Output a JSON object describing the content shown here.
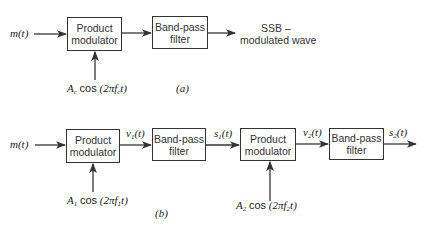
{
  "diagram_a": {
    "input_label": "m(t)",
    "modulator": {
      "line1": "Product",
      "line2": "modulator"
    },
    "filter": {
      "line1": "Band-pass",
      "line2": "filter"
    },
    "output": {
      "line1": "SSB –",
      "line2": "modulated wave"
    },
    "carrier": {
      "amp": "A",
      "amp_sub": "c",
      "cos": "cos",
      "arg_pre": "(2πf",
      "arg_sub": "c",
      "arg_post": "t)"
    },
    "caption": "(a)"
  },
  "diagram_b": {
    "input_label": "m(t)",
    "modulator1": {
      "line1": "Product",
      "line2": "modulator"
    },
    "v1": {
      "base": "v",
      "sub": "1",
      "rest": "(t)"
    },
    "filter1": {
      "line1": "Band-pass",
      "line2": "filter"
    },
    "s1": {
      "base": "s",
      "sub": "1",
      "rest": "(t)"
    },
    "modulator2": {
      "line1": "Product",
      "line2": "modulator"
    },
    "v2": {
      "base": "v",
      "sub": "2",
      "rest": "(t)"
    },
    "filter2": {
      "line1": "Band-pass",
      "line2": "filter"
    },
    "s2": {
      "base": "s",
      "sub": "2",
      "rest": "(t)"
    },
    "carrier1": {
      "amp": "A",
      "amp_sub": "1",
      "cos": "cos",
      "arg_pre": "(2πf",
      "arg_sub": "1",
      "arg_post": "t)"
    },
    "carrier2": {
      "amp": "A",
      "amp_sub": "2",
      "cos": "cos",
      "arg_pre": "(2πf",
      "arg_sub": "2",
      "arg_post": "t)"
    },
    "caption": "(b)"
  }
}
